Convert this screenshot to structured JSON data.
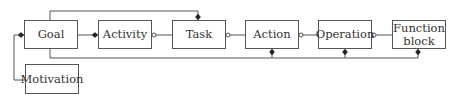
{
  "diagram": {
    "nodes": [
      {
        "id": "goal",
        "label": "Goal",
        "x": 24,
        "y": 20,
        "w": 54,
        "h": 29
      },
      {
        "id": "activity",
        "label": "Activity",
        "x": 98,
        "y": 20,
        "w": 54,
        "h": 29
      },
      {
        "id": "task",
        "label": "Task",
        "x": 172,
        "y": 20,
        "w": 54,
        "h": 29
      },
      {
        "id": "action",
        "label": "Action",
        "x": 245,
        "y": 20,
        "w": 54,
        "h": 29
      },
      {
        "id": "operation",
        "label": "Operation",
        "x": 318,
        "y": 20,
        "w": 54,
        "h": 29
      },
      {
        "id": "function_block",
        "label": "Function\nblock",
        "x": 392,
        "y": 20,
        "w": 54,
        "h": 29
      },
      {
        "id": "motivation",
        "label": "Motivation",
        "x": 25,
        "y": 64,
        "w": 54,
        "h": 30
      }
    ],
    "edges": [
      {
        "from": "goal",
        "to": "activity",
        "type": "composition",
        "end": "filled-diamond"
      },
      {
        "from": "activity",
        "to": "task",
        "type": "aggregation",
        "end": "hollow-circle"
      },
      {
        "from": "task",
        "to": "action",
        "type": "aggregation",
        "end": "hollow-circle"
      },
      {
        "from": "action",
        "to": "operation",
        "type": "aggregation",
        "end": "hollow-circle"
      },
      {
        "from": "operation",
        "to": "function_block",
        "type": "aggregation",
        "end": "hollow-circle"
      },
      {
        "from": "goal",
        "to": "task",
        "type": "composition",
        "route": "top",
        "end": "filled-diamond"
      },
      {
        "from": "goal",
        "to": [
          "action",
          "operation",
          "function_block"
        ],
        "type": "composition",
        "route": "bottom",
        "end": "filled-diamond"
      },
      {
        "from": "motivation",
        "to": "goal",
        "type": "composition",
        "route": "left",
        "end": "filled-diamond"
      }
    ],
    "colors": {
      "stroke": "#555555",
      "text": "#333333",
      "background": "#ffffff"
    }
  }
}
